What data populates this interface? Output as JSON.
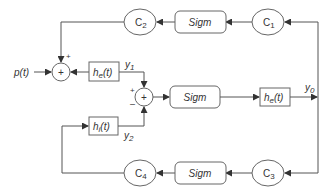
{
  "diagram": {
    "input": {
      "label": "p(t)"
    },
    "blocks": {
      "c1": {
        "main": "C",
        "sub": "1"
      },
      "c2": {
        "main": "C",
        "sub": "2"
      },
      "c3": {
        "main": "C",
        "sub": "3"
      },
      "c4": {
        "main": "C",
        "sub": "4"
      },
      "sigm_top": {
        "label": "Sigm"
      },
      "sigm_mid": {
        "label": "Sigm"
      },
      "sigm_bot": {
        "label": "Sigm"
      },
      "he_left": {
        "main": "h",
        "sub": "e",
        "arg": "(t)"
      },
      "he_right": {
        "main": "h",
        "sub": "e",
        "arg": "(t)"
      },
      "hi": {
        "main": "h",
        "sub": "i",
        "arg": "(t)"
      }
    },
    "signals": {
      "y0": {
        "main": "y",
        "sub": "0"
      },
      "y1": {
        "main": "y",
        "sub": "1"
      },
      "y2": {
        "main": "y",
        "sub": "2"
      }
    },
    "sum_signs": {
      "left_top": "+",
      "mid_top": "+",
      "mid_bottom": "–"
    },
    "sum_symbol": "+"
  }
}
